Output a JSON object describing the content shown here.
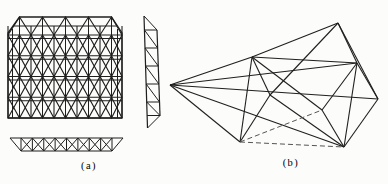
{
  "page": {
    "background": "#fcfcfa",
    "line_color": "#1f1f1f",
    "hidden_line_color": "#555555"
  },
  "figure_a": {
    "caption": "(a)"
  },
  "figure_b": {
    "caption": "(b)"
  }
}
